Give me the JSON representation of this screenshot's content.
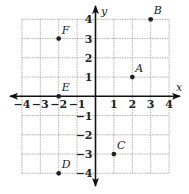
{
  "diagram": {
    "type": "coordinate-plane",
    "x_range": [
      -4,
      4
    ],
    "y_range": [
      -4,
      4
    ],
    "grid": true,
    "x_axis_label": "x",
    "y_axis_label": "y",
    "x_ticks": [
      "−4",
      "−3",
      "−2",
      "−1",
      "1",
      "2",
      "3",
      "4"
    ],
    "x_tick_values": [
      -4,
      -3,
      -2,
      -1,
      1,
      2,
      3,
      4
    ],
    "y_ticks": [
      "4",
      "3",
      "2",
      "1",
      "−1",
      "−2",
      "−3",
      "−4"
    ],
    "y_tick_values": [
      4,
      3,
      2,
      1,
      -1,
      -2,
      -3,
      -4
    ],
    "points": [
      {
        "label": "A",
        "x": 2,
        "y": 1
      },
      {
        "label": "B",
        "x": 3,
        "y": 4
      },
      {
        "label": "C",
        "x": 1,
        "y": -3
      },
      {
        "label": "D",
        "x": -2,
        "y": -4
      },
      {
        "label": "E",
        "x": -2,
        "y": 0
      },
      {
        "label": "F",
        "x": -2,
        "y": 3
      }
    ],
    "colors": {
      "grid": "#9a9a9a",
      "axis": "#111111",
      "point": "#222222"
    }
  }
}
